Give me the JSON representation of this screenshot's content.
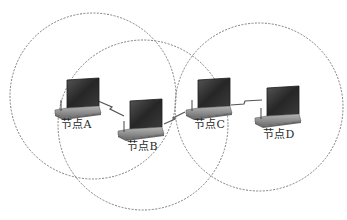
{
  "diagram": {
    "type": "wireless ad hoc network topology",
    "colors": {
      "circle_stroke": "#707070",
      "link_stroke": "#555555",
      "screen": "#2b2b2b",
      "body": "#8c8c8c",
      "label": "#2a2a2a"
    },
    "ranges": [
      {
        "id": "range-A",
        "cx": 93,
        "cy": 96,
        "r": 83
      },
      {
        "id": "range-B",
        "cx": 143,
        "cy": 125,
        "r": 85
      },
      {
        "id": "range-C",
        "cx": 259,
        "cy": 107,
        "r": 84
      }
    ],
    "nodes": [
      {
        "id": "A",
        "label": "节点A",
        "x": 55,
        "y": 78,
        "label_x": 62,
        "label_y": 116
      },
      {
        "id": "B",
        "label": "节点B",
        "x": 118,
        "y": 99,
        "label_x": 128,
        "label_y": 138
      },
      {
        "id": "C",
        "label": "节点C",
        "x": 186,
        "y": 78,
        "label_x": 195,
        "label_y": 116
      },
      {
        "id": "D",
        "label": "节点D",
        "x": 255,
        "y": 86,
        "label_x": 263,
        "label_y": 126
      }
    ],
    "links": [
      {
        "from": "A",
        "to": "B"
      },
      {
        "from": "B",
        "to": "C"
      },
      {
        "from": "C",
        "to": "D"
      }
    ]
  }
}
